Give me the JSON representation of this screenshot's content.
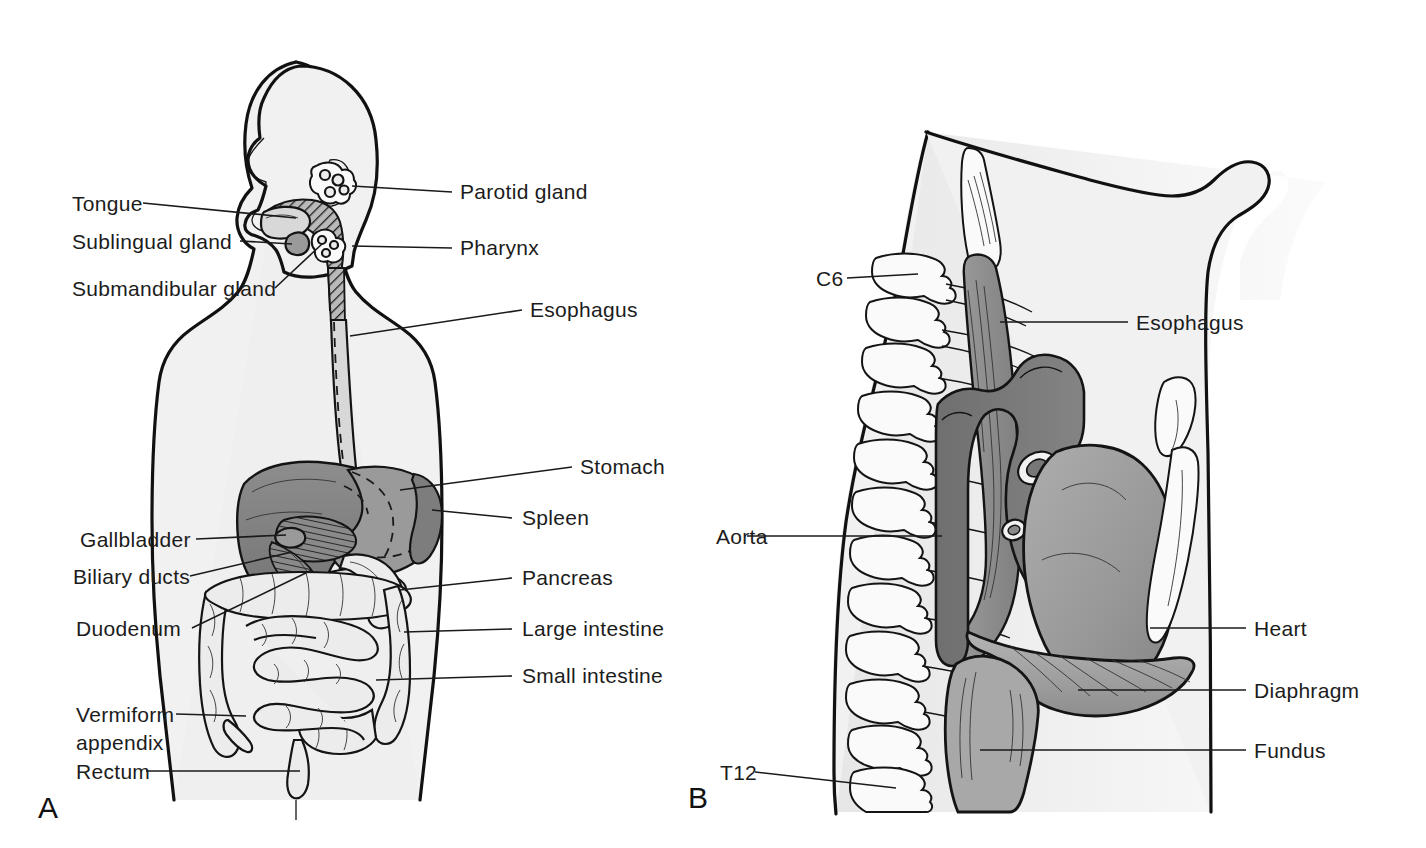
{
  "figure": {
    "background_color": "#ffffff",
    "line_color": "#1a1a1a",
    "label_color": "#1c1c1c"
  },
  "panels": [
    {
      "letter": "A",
      "name": "digestive-system-overview",
      "description": "Anterior view of human torso showing the alimentary canal and accessory digestive organs",
      "labels_left": [
        {
          "id": "tongue",
          "text": "Tongue"
        },
        {
          "id": "sublingual-gland",
          "text": "Sublingual gland"
        },
        {
          "id": "submandibular-gland",
          "text": "Submandibular gland"
        },
        {
          "id": "gallbladder",
          "text": "Gallbladder"
        },
        {
          "id": "biliary-ducts",
          "text": "Biliary ducts"
        },
        {
          "id": "duodenum",
          "text": "Duodenum"
        },
        {
          "id": "vermiform-appendix",
          "text": "Vermiform",
          "text2": "appendix"
        },
        {
          "id": "rectum",
          "text": "Rectum"
        }
      ],
      "labels_right": [
        {
          "id": "parotid-gland",
          "text": "Parotid gland"
        },
        {
          "id": "pharynx",
          "text": "Pharynx"
        },
        {
          "id": "esophagus",
          "text": "Esophagus"
        },
        {
          "id": "stomach",
          "text": "Stomach"
        },
        {
          "id": "spleen",
          "text": "Spleen"
        },
        {
          "id": "pancreas",
          "text": "Pancreas"
        },
        {
          "id": "large-intestine",
          "text": "Large intestine"
        },
        {
          "id": "small-intestine",
          "text": "Small intestine"
        }
      ]
    },
    {
      "letter": "B",
      "name": "thoracic-esophagus-sagittal",
      "description": "Sagittal view of the thorax showing the esophagus coursing from C6 to the gastric fundus past the aortic arch, heart and diaphragm",
      "labels_left": [
        {
          "id": "c6",
          "text": "C6"
        },
        {
          "id": "aorta",
          "text": "Aorta"
        },
        {
          "id": "t12",
          "text": "T12"
        }
      ],
      "labels_right": [
        {
          "id": "esophagus-b",
          "text": "Esophagus"
        },
        {
          "id": "heart",
          "text": "Heart"
        },
        {
          "id": "diaphragm",
          "text": "Diaphragm"
        },
        {
          "id": "fundus",
          "text": "Fundus"
        }
      ]
    }
  ],
  "colors": {
    "body_fill": "#f1f1f1",
    "organ_dark": "#7d7d7d",
    "organ_mid": "#9a9a9a",
    "organ_light": "#d8d8d8",
    "organ_pale": "#ececec",
    "outline": "#111111"
  }
}
